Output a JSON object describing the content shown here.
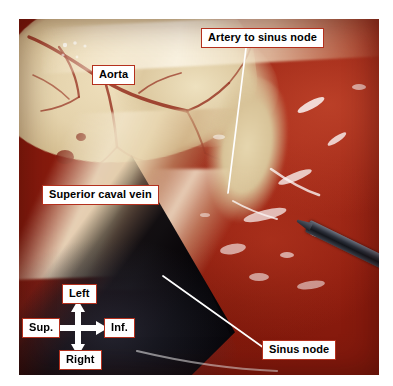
{
  "figure": {
    "kind": "anatomical-photograph",
    "background_color": "#ffffff",
    "label_box_background": "#ffffff",
    "label_box_border_color": "#b4301d",
    "label_text_color": "#000000",
    "leader_line_color": "#ffffff",
    "arrow_color": "#ffffff"
  },
  "labels": {
    "artery_to_sinus_node": "Artery to sinus node",
    "aorta": "Aorta",
    "superior_caval_vein": "Superior caval vein",
    "sinus_node": "Sinus node"
  },
  "orientation": {
    "up": "Left",
    "down": "Right",
    "left": "Sup.",
    "right": "Inf."
  },
  "leaders": [
    {
      "name": "artery-to-sinus-node-leader",
      "from": [
        246,
        48
      ],
      "to": [
        228,
        193
      ]
    },
    {
      "name": "sinus-node-leader",
      "from": [
        163,
        276
      ],
      "to": [
        264,
        348
      ]
    }
  ]
}
